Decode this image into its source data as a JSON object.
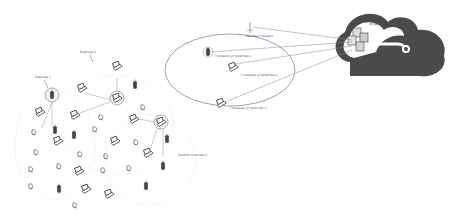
{
  "diagram": {
    "cloud": {
      "label": "Облачный сервер",
      "color": "#555555"
    },
    "base_station": {
      "label": "Базовая станция"
    },
    "cell": {
      "nodes": [
        {
          "label": "Головное устройство 1"
        },
        {
          "label": "Головное устройство 2"
        },
        {
          "label": "Головное устройство 3"
        }
      ]
    },
    "clusters": [
      {
        "label": "Кластер 1"
      },
      {
        "label": "Кластер 2"
      },
      {
        "label": "Кластер 3"
      }
    ],
    "line_color": "#888888",
    "ellipse_color": "#666666"
  }
}
